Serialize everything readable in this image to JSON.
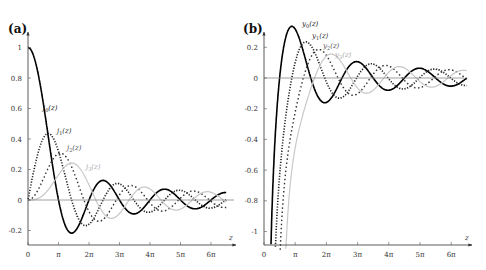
{
  "chart_data": [
    {
      "type": "line",
      "panel_label": "(a)",
      "title": "",
      "xlabel": "z",
      "ylabel": "",
      "xlim": [
        0,
        6.5
      ],
      "xlim_units": "pi",
      "ylim": [
        -0.3,
        1.1
      ],
      "grid": false,
      "x_ticks": [
        "0",
        "π",
        "2π",
        "3π",
        "4π",
        "5π",
        "6π"
      ],
      "y_ticks": [
        "-0.2",
        "0",
        "0.2",
        "0.4",
        "0.6",
        "0.8",
        "1"
      ],
      "y_tick_values": [
        -0.2,
        0,
        0.2,
        0.4,
        0.6,
        0.8,
        1
      ],
      "series": [
        {
          "name": "j0(z)",
          "label_main": "j",
          "label_sub": "0",
          "order": 0,
          "kind": "j",
          "style": "solid",
          "color": "#000000",
          "peak": [
            0,
            1.0
          ],
          "min": [
            4.49,
            -0.217
          ]
        },
        {
          "name": "j1(z)",
          "label_main": "j",
          "label_sub": "1",
          "order": 1,
          "kind": "j",
          "style": "dotted",
          "color": "#222222",
          "peak": [
            2.08,
            0.436
          ]
        },
        {
          "name": "j2(z)",
          "label_main": "j",
          "label_sub": "2",
          "order": 2,
          "kind": "j",
          "style": "dashed-dots",
          "color": "#333333",
          "peak": [
            3.34,
            0.307
          ]
        },
        {
          "name": "j3(z)",
          "label_main": "j",
          "label_sub": "3",
          "order": 3,
          "kind": "j",
          "style": "light",
          "color": "#c8c8c8",
          "peak": [
            4.51,
            0.242
          ]
        }
      ]
    },
    {
      "type": "line",
      "panel_label": "(b)",
      "title": "",
      "xlabel": "z",
      "ylabel": "",
      "xlim": [
        0,
        6.5
      ],
      "xlim_units": "pi",
      "ylim": [
        -1.1,
        0.3
      ],
      "grid": false,
      "x_ticks": [
        "0",
        "π",
        "2π",
        "3π",
        "4π",
        "5π",
        "6π"
      ],
      "y_ticks": [
        "-1",
        "-0.8",
        "-0.6",
        "-0.4",
        "-0.2",
        "0",
        "0.2"
      ],
      "y_tick_values": [
        -1,
        -0.8,
        -0.6,
        -0.4,
        -0.2,
        0,
        0.2
      ],
      "series": [
        {
          "name": "y0(z)",
          "label_main": "y",
          "label_sub": "0",
          "order": 0,
          "kind": "y",
          "style": "solid",
          "color": "#000000",
          "peak": [
            2.8,
            0.336
          ]
        },
        {
          "name": "y1(z)",
          "label_main": "y",
          "label_sub": "1",
          "order": 1,
          "kind": "y",
          "style": "dotted",
          "color": "#222222",
          "peak": [
            4.49,
            0.223
          ]
        },
        {
          "name": "y2(z)",
          "label_main": "y",
          "label_sub": "2",
          "order": 2,
          "kind": "y",
          "style": "dashed-dots",
          "color": "#333333",
          "peak": [
            5.95,
            0.18
          ]
        },
        {
          "name": "y3(z)",
          "label_main": "y",
          "label_sub": "3",
          "order": 3,
          "kind": "y",
          "style": "light",
          "color": "#c8c8c8",
          "peak": [
            7.27,
            0.14
          ]
        }
      ]
    }
  ],
  "panels": {
    "a": {
      "label": "(a)",
      "axis_label": "z"
    },
    "b": {
      "label": "(b)",
      "axis_label": "z"
    }
  }
}
